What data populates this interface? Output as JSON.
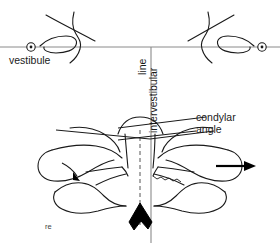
{
  "figure": {
    "type": "anatomical-line-diagram",
    "background_color": "#ffffff",
    "stroke_color": "#1a1a1a",
    "fill_color": "#000000",
    "reference_line_color": "#777777"
  },
  "labels": {
    "vestibule": "vestibule",
    "intervestibular": "intervestibular",
    "line": "line",
    "condylar": "condylar",
    "angle": "angle",
    "corner_note": "re"
  },
  "markers": {
    "left_vestibule_point": {
      "x": 31,
      "y": 47
    },
    "right_vestibule_point": {
      "x": 262,
      "y": 47
    },
    "horizontal_reference_y": 47,
    "vertical_midline_x": 151,
    "vertical_midline_top": 47,
    "vertical_midline_bottom": 243,
    "dashed_midline_x": 140,
    "direction_arrow": {
      "x": 232,
      "y": 166,
      "points": "right"
    },
    "small_arrow": {
      "x": 78,
      "y": 175,
      "points": "down-right"
    }
  },
  "icons": {
    "vestibule_marker": "circled-dot-icon",
    "direction_arrow": "arrow-right-icon",
    "spinous_marker": "solid-chevron-icon"
  }
}
